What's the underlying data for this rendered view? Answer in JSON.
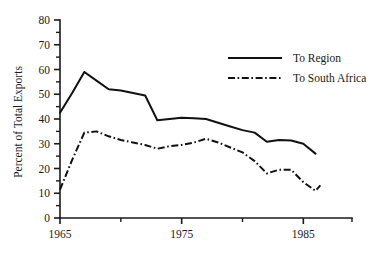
{
  "chart_data": {
    "type": "line",
    "title": "",
    "xlabel": "",
    "ylabel": "Percent of Total Exports",
    "xlim": [
      1965,
      1989
    ],
    "ylim": [
      0,
      80
    ],
    "grid": false,
    "legend_position": "upper right",
    "y_ticks": [
      0,
      10,
      20,
      30,
      40,
      50,
      60,
      70,
      80
    ],
    "y_tick_labels": [
      "0",
      "10",
      "20",
      "30",
      "40",
      "50",
      "60",
      "70",
      "80"
    ],
    "y_minor_ticks": [
      5,
      15,
      25,
      35,
      45,
      55,
      65,
      75
    ],
    "x_ticks": [
      1965,
      1975,
      1985
    ],
    "x_tick_labels": [
      "1965",
      "1975",
      "1985"
    ],
    "x_minor_ticks": [
      1970,
      1980,
      1989
    ],
    "x": [
      1965,
      1966,
      1967,
      1968,
      1969,
      1970,
      1971,
      1972,
      1973,
      1974,
      1975,
      1976,
      1977,
      1978,
      1979,
      1980,
      1981,
      1982,
      1983,
      1984,
      1985,
      1986
    ],
    "series": [
      {
        "name": "To Region",
        "style": "solid",
        "values": [
          42.5,
          50.5,
          59.0,
          55.5,
          52.0,
          51.5,
          50.5,
          49.5,
          39.5,
          40.0,
          40.5,
          40.3,
          40.0,
          38.5,
          37.0,
          35.5,
          34.5,
          30.8,
          31.5,
          31.3,
          30.0,
          26.0
        ]
      },
      {
        "name": "To South Africa",
        "style": "dash-dot",
        "values": [
          11.5,
          23.5,
          34.5,
          35.0,
          33.0,
          31.5,
          30.5,
          29.5,
          28.0,
          29.0,
          29.5,
          30.5,
          32.0,
          30.5,
          28.5,
          26.5,
          23.0,
          18.0,
          19.5,
          19.5,
          14.5,
          11.0
        ]
      }
    ],
    "series_endpoint_extra": {
      "To South Africa": {
        "x": 1986.4,
        "y": 13.2
      }
    },
    "legend": [
      {
        "label": "To Region",
        "style": "solid"
      },
      {
        "label": "To South Africa",
        "style": "dash-dot"
      }
    ],
    "colors": {
      "line": "#111111",
      "axis": "#1a1a1a",
      "background": "#ffffff"
    }
  }
}
